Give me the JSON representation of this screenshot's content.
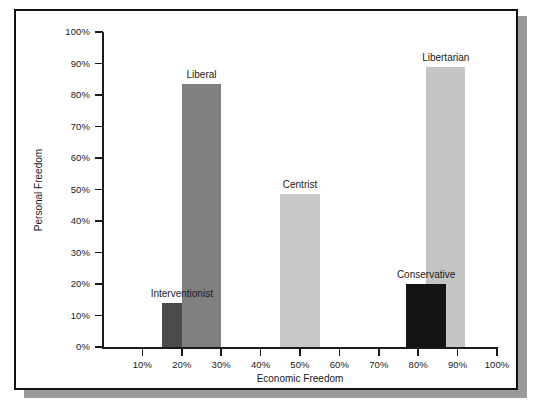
{
  "chart_data": {
    "type": "bar",
    "title": "",
    "xlabel": "Economic Freedom",
    "ylabel": "Personal Freedom",
    "xlim": [
      0,
      100
    ],
    "ylim": [
      0,
      100
    ],
    "grid": false,
    "legend": "none",
    "x_ticks": [
      "10%",
      "20%",
      "30%",
      "40%",
      "50%",
      "60%",
      "70%",
      "80%",
      "90%",
      "100%"
    ],
    "x_tick_values": [
      10,
      20,
      30,
      40,
      50,
      60,
      70,
      80,
      90,
      100
    ],
    "y_ticks": [
      "0%",
      "10%",
      "20%",
      "30%",
      "40%",
      "50%",
      "60%",
      "70%",
      "80%",
      "90%",
      "100%"
    ],
    "y_tick_values": [
      0,
      10,
      20,
      30,
      40,
      50,
      60,
      70,
      80,
      90,
      100
    ],
    "categories": [
      "Interventionist",
      "Liberal",
      "Centrist",
      "Libertarian",
      "Conservative"
    ],
    "values": [
      14,
      83.5,
      48.5,
      89,
      20
    ],
    "bars": [
      {
        "name": "Interventionist",
        "economic_freedom": 20,
        "personal_freedom": 14,
        "x_start": 15,
        "x_end": 25,
        "color": "#4a4a4a",
        "label_above": true
      },
      {
        "name": "Liberal",
        "economic_freedom": 25,
        "personal_freedom": 83.5,
        "x_start": 20,
        "x_end": 30,
        "color": "#808080",
        "label_above": true
      },
      {
        "name": "Centrist",
        "economic_freedom": 50,
        "personal_freedom": 48.5,
        "x_start": 45,
        "x_end": 55,
        "color": "#c9c9c9",
        "label_above": true
      },
      {
        "name": "Libertarian",
        "economic_freedom": 87,
        "personal_freedom": 89,
        "x_start": 82,
        "x_end": 92,
        "color": "#c5c5c5",
        "label_above": true
      },
      {
        "name": "Conservative",
        "economic_freedom": 82,
        "personal_freedom": 20,
        "x_start": 77,
        "x_end": 87,
        "color": "#141414",
        "label_above": true
      }
    ]
  },
  "figure": {
    "frame_color": "#111111",
    "shadow_color": "#9a9a9a",
    "background": "#ffffff"
  }
}
